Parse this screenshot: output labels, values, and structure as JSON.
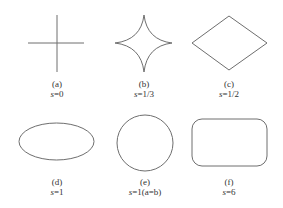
{
  "figure": {
    "panels": [
      {
        "id": "a",
        "label": "(a)",
        "param_var": "s",
        "param_eq": "=0",
        "shape": "cross"
      },
      {
        "id": "b",
        "label": "(b)",
        "param_var": "s",
        "param_eq": "=1/3",
        "shape": "astroid"
      },
      {
        "id": "c",
        "label": "(c)",
        "param_var": "s",
        "param_eq": "=1/2",
        "shape": "diamond"
      },
      {
        "id": "d",
        "label": "(d)",
        "param_var": "s",
        "param_eq": "=1",
        "shape": "ellipse"
      },
      {
        "id": "e",
        "label": "(e)",
        "param_var": "s",
        "param_eq": "=1(a=b)",
        "shape": "circle"
      },
      {
        "id": "f",
        "label": "(f)",
        "param_var": "s",
        "param_eq": "=6",
        "shape": "rounded-rectangle"
      }
    ],
    "stroke_color": "#6e6e6e"
  }
}
